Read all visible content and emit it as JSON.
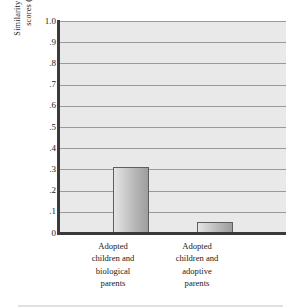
{
  "chart_data": {
    "type": "bar",
    "title": "",
    "xlabel": "",
    "ylabel": "Similarity of intelligence scores (correlation)",
    "ylabel_lines": [
      "Similarity of intelligence",
      "scores (correlation)"
    ],
    "categories": [
      "Adopted children and biological parents",
      "Adopted children and adoptive parents"
    ],
    "category_lines": [
      [
        "Adopted",
        "children and",
        "biological",
        "parents"
      ],
      [
        "Adopted",
        "children and",
        "adoptive",
        "parents"
      ]
    ],
    "values": [
      0.31,
      0.05
    ],
    "ylim": [
      0,
      1.0
    ],
    "ytick_values": [
      1.0,
      0.9,
      0.8,
      0.7,
      0.6,
      0.5,
      0.4,
      0.3,
      0.2,
      0.1,
      0
    ],
    "ytick_labels": [
      "1.0",
      ".9",
      ".8",
      ".7",
      ".6",
      ".5",
      ".4",
      ".3",
      ".2",
      ".1",
      "0"
    ],
    "grid": true,
    "grid_axis": "y",
    "legend": false,
    "legend_position": "none",
    "colors": {
      "plot_background": "#e9e9e9",
      "gridline": "#9a9a9a",
      "axis": "#3a3a3a",
      "bar_fill_light": "#e4e4e4",
      "bar_fill_dark": "#9e9e9e",
      "bar_border": "#5e5e5e",
      "text": "#1a1a1a",
      "page_background": "#ffffff"
    }
  }
}
